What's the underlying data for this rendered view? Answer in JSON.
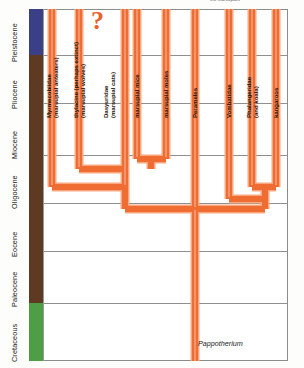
{
  "figure": {
    "top_caption": "the marsupials",
    "root_taxon": "Pappotherium",
    "uncertainty_marker": "?",
    "accent_color": "#ef6c33",
    "accent_light": "#f9a77e",
    "grid_color": "#8f8f8f"
  },
  "time_axis": {
    "label": "Epoch",
    "epochs": [
      {
        "name": "Pleistocene",
        "color": "#3b3f86",
        "top": 0,
        "height": 46
      },
      {
        "name": "Pliocene",
        "color": "#5e3a22",
        "top": 46,
        "height": 48
      },
      {
        "name": "Miocene",
        "color": "#5e3a22",
        "top": 94,
        "height": 52
      },
      {
        "name": "Oligocene",
        "color": "#5e3a22",
        "top": 146,
        "height": 48
      },
      {
        "name": "Eocene",
        "color": "#5e3a22",
        "top": 194,
        "height": 48
      },
      {
        "name": "Paleocene",
        "color": "#5e3a22",
        "top": 242,
        "height": 52
      },
      {
        "name": "Cretaceous",
        "color": "#4e9e45",
        "top": 294,
        "height": 58
      }
    ],
    "gridlines_y": [
      46,
      94,
      146,
      194,
      242,
      294
    ]
  },
  "taxa": [
    {
      "name": "Myrmecobiidae",
      "common": "(marsupial anteaters)",
      "lineage_x": 23
    },
    {
      "name": "thylacine (perhaps extinct)",
      "common": "(marsupial wolves)",
      "lineage_x": 50
    },
    {
      "name": "Dasyuridae",
      "common": "(marsupial cats)",
      "lineage_x": 80
    },
    {
      "name": "marsupial mice",
      "common": "",
      "lineage_x": 108
    },
    {
      "name": "marsupial moles",
      "common": "",
      "lineage_x": 137
    },
    {
      "name": "Perameles",
      "common": "",
      "lineage_x": 166
    },
    {
      "name": "Vombatidae",
      "common": "",
      "lineage_x": 200
    },
    {
      "name": "Phalangeridae",
      "common": "(and koala)",
      "lineage_x": 223
    },
    {
      "name": "kangaroos",
      "common": "",
      "lineage_x": 247
    }
  ],
  "chart_data": {
    "type": "diagram",
    "title": "the marsupials",
    "subtype": "phylogenetic-tree",
    "xlabel": "",
    "ylabel": "Epoch",
    "grid": true,
    "legend_position": "none",
    "tip_labels": [
      "Myrmecobiidae (marsupial anteaters)",
      "thylacine (perhaps extinct) (marsupial wolves)",
      "Dasyuridae (marsupial cats)",
      "marsupial mice",
      "marsupial moles",
      "Perameles",
      "Vombatidae",
      "Phalangeridae (and koala)",
      "kangaroos"
    ],
    "root_label": "Pappotherium",
    "annotations": [
      "?"
    ],
    "epoch_order": [
      "Pleistocene",
      "Pliocene",
      "Miocene",
      "Oligocene",
      "Eocene",
      "Paleocene",
      "Cretaceous"
    ],
    "nodes": [
      {
        "id": "root",
        "epoch": "Cretaceous",
        "children": [
          "nodeA",
          "nodeB"
        ]
      },
      {
        "id": "nodeA",
        "epoch": "Eocene",
        "children": [
          "n1",
          "n2"
        ]
      },
      {
        "id": "nodeB",
        "epoch": "Eocene",
        "children": [
          "n3",
          "n4"
        ]
      }
    ]
  }
}
